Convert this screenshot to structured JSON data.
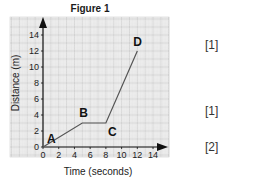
{
  "figure": {
    "title": "Figure 1"
  },
  "marks": [
    "[1]",
    "[1]",
    "[2]"
  ],
  "chart_data": {
    "type": "line",
    "title": "Figure 1",
    "xlabel": "Time (seconds)",
    "ylabel": "Distance (m)",
    "xlim": [
      0,
      14
    ],
    "ylim": [
      0,
      14
    ],
    "xticks": [
      0,
      2,
      4,
      6,
      8,
      10,
      12,
      14
    ],
    "yticks": [
      0,
      2,
      4,
      6,
      8,
      10,
      12,
      14
    ],
    "grid": true,
    "series": [
      {
        "name": "journey",
        "x": [
          0,
          5,
          8,
          12
        ],
        "y": [
          0,
          3,
          3,
          12
        ]
      }
    ],
    "point_labels": [
      {
        "label": "A",
        "x": 0,
        "y": 0
      },
      {
        "label": "B",
        "x": 5,
        "y": 3
      },
      {
        "label": "C",
        "x": 8,
        "y": 3
      },
      {
        "label": "D",
        "x": 12,
        "y": 12
      }
    ]
  }
}
